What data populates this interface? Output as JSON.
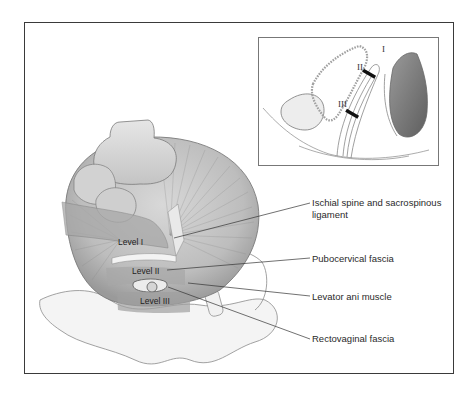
{
  "figure": {
    "main_illustration": {
      "levels": [
        {
          "label": "Level I"
        },
        {
          "label": "Level II"
        },
        {
          "label": "Level III"
        }
      ],
      "annotations": [
        {
          "label": "Ischial spine and sacrospinous",
          "label_line2": "ligament"
        },
        {
          "label": "Pubocervical fascia"
        },
        {
          "label": "Levator ani muscle"
        },
        {
          "label": "Rectovaginal fascia"
        }
      ]
    },
    "inset": {
      "roman_levels": [
        "I",
        "II",
        "III"
      ]
    },
    "colors": {
      "frame": "#3a3a3a",
      "inset_border": "#777777",
      "tissue_light": "#d9d9d9",
      "tissue_mid": "#b3b3b3",
      "tissue_dark": "#6e6e6e",
      "leader_line": "#333333"
    }
  }
}
